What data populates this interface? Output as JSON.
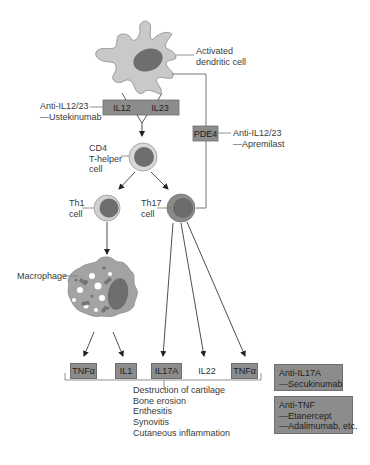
{
  "diagram": {
    "cells": {
      "dendritic": {
        "label_line1": "Activated",
        "label_line2": "dendritic cell"
      },
      "cd4": {
        "label_line1": "CD4",
        "label_line2": "T-helper",
        "label_line3": "cell"
      },
      "th1": {
        "label_line1": "Th1",
        "label_line2": "cell"
      },
      "th17": {
        "label_line1": "Th17",
        "label_line2": "cell"
      },
      "macrophage": {
        "label": "Macrophage"
      }
    },
    "cytokine_bar": {
      "left": "IL12",
      "right": "IL23"
    },
    "pde4": {
      "label": "PDE4"
    },
    "drugs": {
      "ustekinumab": {
        "line1": "Anti-IL12/23",
        "line2": "—Ustekinumab"
      },
      "apremilast": {
        "line1": "Anti-IL12/23",
        "line2": "—Apremilast"
      },
      "secukinumab": {
        "line1": "Anti-IL17A",
        "line2": "—Secukinumab"
      },
      "anti_tnf": {
        "line1": "Anti-TNF",
        "line2": "—Etanercept",
        "line3": "—Adalimumab, etc."
      }
    },
    "cytokines": [
      {
        "label": "TNFα",
        "boxed": true
      },
      {
        "label": "IL1",
        "boxed": true
      },
      {
        "label": "IL17A",
        "boxed": true
      },
      {
        "label": "IL22",
        "boxed": false
      },
      {
        "label": "TNFα",
        "boxed": true
      }
    ],
    "outcomes": [
      "Destruction of cartilage",
      "Bone erosion",
      "Enthesitis",
      "Synovitis",
      "Cutaneous inflammation"
    ],
    "colors": {
      "box_fill": "#8c8c8c",
      "cell_light": "#c9c9c9",
      "nucleus": "#6e6e6e",
      "line": "#666666",
      "text": "#3a3a3a"
    }
  }
}
